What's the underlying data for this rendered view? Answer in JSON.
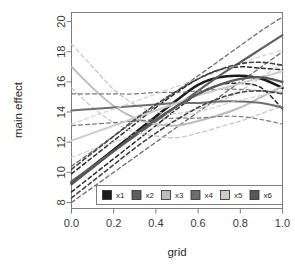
{
  "chart_data": {
    "type": "line",
    "title": "",
    "xlabel": "grid",
    "ylabel": "main effect",
    "xlim": [
      0.0,
      1.0
    ],
    "ylim": [
      7.6,
      20.6
    ],
    "grid": false,
    "xticks": [
      "0.0",
      "0.2",
      "0.4",
      "0.6",
      "0.8",
      "1.0"
    ],
    "xtick_values": [
      0.0,
      0.2,
      0.4,
      0.6,
      0.8,
      1.0
    ],
    "yticks": [
      "8",
      "10",
      "12",
      "14",
      "16",
      "18",
      "20"
    ],
    "ytick_values": [
      8,
      10,
      12,
      14,
      16,
      18,
      20
    ],
    "legend": {
      "position": "bottom",
      "entries": [
        {
          "label": "x1",
          "color": "#1c1c1c"
        },
        {
          "label": "x2",
          "color": "#5f5f5f"
        },
        {
          "label": "x3",
          "color": "#bdbdbd"
        },
        {
          "label": "x4",
          "color": "#6e6e6e"
        },
        {
          "label": "x5",
          "color": "#cacaca"
        },
        {
          "label": "x6",
          "color": "#585858"
        }
      ]
    },
    "x": [
      0.0,
      0.1,
      0.2,
      0.3,
      0.4,
      0.5,
      0.6,
      0.7,
      0.8,
      0.9,
      1.0
    ],
    "series": [
      {
        "name": "x1-main",
        "label": "x1",
        "color": "#1c1c1c",
        "width": 2.6,
        "dash": "solid",
        "values": [
          9.3,
          10.4,
          11.5,
          12.6,
          13.7,
          14.8,
          15.8,
          16.3,
          16.4,
          16.2,
          15.6
        ]
      },
      {
        "name": "x1-upper",
        "label": "x1",
        "color": "#2b2b2b",
        "width": 1.5,
        "dash": "dashed",
        "values": [
          9.9,
          11.0,
          12.1,
          13.2,
          14.3,
          15.3,
          16.2,
          16.8,
          17.0,
          16.9,
          16.8
        ]
      },
      {
        "name": "x1-lower",
        "label": "x1",
        "color": "#2b2b2b",
        "width": 1.5,
        "dash": "dashed",
        "values": [
          8.7,
          9.8,
          10.9,
          12.0,
          13.1,
          14.2,
          15.2,
          15.8,
          15.9,
          15.6,
          14.2
        ]
      },
      {
        "name": "x2-main",
        "label": "x2",
        "color": "#5f5f5f",
        "width": 2.2,
        "dash": "solid",
        "values": [
          9.4,
          10.4,
          11.4,
          12.4,
          13.4,
          14.4,
          15.4,
          16.4,
          17.3,
          18.2,
          19.1
        ]
      },
      {
        "name": "x2-upper",
        "label": "x2",
        "color": "#6b6b6b",
        "width": 1.3,
        "dash": "dashed",
        "values": [
          10.4,
          11.4,
          12.4,
          13.4,
          14.4,
          15.4,
          16.4,
          17.4,
          18.4,
          19.4,
          20.3
        ]
      },
      {
        "name": "x2-lower",
        "label": "x2",
        "color": "#6b6b6b",
        "width": 1.3,
        "dash": "dashed",
        "values": [
          8.0,
          9.0,
          10.0,
          11.0,
          12.0,
          13.0,
          14.0,
          15.0,
          16.0,
          17.0,
          18.0
        ]
      },
      {
        "name": "x3-main",
        "label": "x3",
        "color": "#bdbdbd",
        "width": 2.0,
        "dash": "solid",
        "values": [
          17.0,
          15.6,
          14.4,
          13.6,
          13.2,
          13.1,
          13.4,
          13.8,
          14.3,
          15.0,
          15.7
        ]
      },
      {
        "name": "x3-upper",
        "label": "x3",
        "color": "#c8c8c8",
        "width": 1.3,
        "dash": "dashed",
        "values": [
          18.5,
          17.0,
          15.5,
          14.5,
          14.0,
          13.9,
          14.2,
          14.7,
          15.4,
          16.3,
          17.2
        ]
      },
      {
        "name": "x3-lower",
        "label": "x3",
        "color": "#c8c8c8",
        "width": 1.3,
        "dash": "dashed",
        "values": [
          15.6,
          14.3,
          13.3,
          12.7,
          12.4,
          12.3,
          12.6,
          13.0,
          13.4,
          13.9,
          14.4
        ]
      },
      {
        "name": "x4-main",
        "label": "x4",
        "color": "#6e6e6e",
        "width": 2.0,
        "dash": "solid",
        "values": [
          14.1,
          14.2,
          14.3,
          14.4,
          14.5,
          14.6,
          14.6,
          14.7,
          14.7,
          14.6,
          14.3
        ]
      },
      {
        "name": "x4-upper",
        "label": "x4",
        "color": "#7a7a7a",
        "width": 1.2,
        "dash": "dashed",
        "values": [
          15.2,
          15.2,
          15.2,
          15.2,
          15.3,
          15.3,
          15.4,
          15.5,
          15.5,
          15.4,
          15.3
        ]
      },
      {
        "name": "x4-lower",
        "label": "x4",
        "color": "#7a7a7a",
        "width": 1.2,
        "dash": "dashed",
        "values": [
          13.1,
          13.2,
          13.3,
          13.4,
          13.5,
          13.6,
          13.6,
          13.7,
          13.7,
          13.5,
          13.2
        ]
      },
      {
        "name": "x5-main",
        "label": "x5",
        "color": "#cacaca",
        "width": 2.0,
        "dash": "solid",
        "values": [
          12.1,
          12.6,
          13.1,
          13.6,
          14.1,
          14.6,
          15.1,
          15.5,
          15.9,
          16.3,
          16.7
        ]
      },
      {
        "name": "x5-upper",
        "label": "x5",
        "color": "#d2d2d2",
        "width": 1.2,
        "dash": "dashed",
        "values": [
          13.2,
          13.7,
          14.2,
          14.7,
          15.2,
          15.7,
          16.2,
          16.7,
          17.2,
          17.7,
          18.1
        ]
      },
      {
        "name": "x5-lower",
        "label": "x5",
        "color": "#d2d2d2",
        "width": 1.2,
        "dash": "dashed",
        "values": [
          11.0,
          11.5,
          12.0,
          12.5,
          13.0,
          13.5,
          14.0,
          14.4,
          14.8,
          15.1,
          15.4
        ]
      },
      {
        "name": "x6-main",
        "label": "x6",
        "color": "#585858",
        "width": 2.2,
        "dash": "solid",
        "values": [
          9.2,
          10.3,
          11.4,
          12.5,
          13.5,
          14.4,
          15.2,
          15.8,
          16.2,
          16.3,
          16.0
        ]
      },
      {
        "name": "x6-upper",
        "label": "x6",
        "color": "#444444",
        "width": 1.6,
        "dash": "dashed",
        "values": [
          10.2,
          11.3,
          12.4,
          13.5,
          14.5,
          15.4,
          16.2,
          16.8,
          17.2,
          17.3,
          17.1
        ]
      },
      {
        "name": "x6-lower",
        "label": "x6",
        "color": "#444444",
        "width": 1.6,
        "dash": "dashed",
        "values": [
          8.3,
          9.4,
          10.5,
          11.6,
          12.6,
          13.5,
          14.3,
          14.9,
          15.3,
          15.4,
          15.2
        ]
      }
    ]
  }
}
